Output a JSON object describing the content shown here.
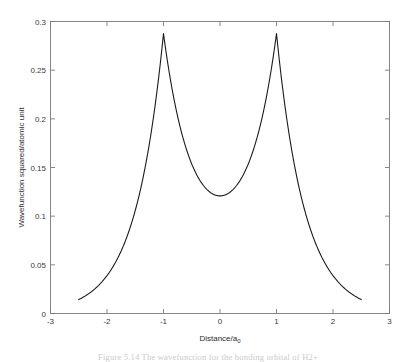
{
  "figure": {
    "background_color": "#ffffff",
    "axes_color": "#7a7a7a",
    "line_color": "#1a1a1a",
    "text_color": "#2b2b2b"
  },
  "caption": {
    "text": "Figure 5.14  The wavefunction for the bonding orbital of H2+"
  },
  "chart_data": {
    "type": "line",
    "title": "",
    "xlabel": "Distance/a",
    "xlabel_subscript": "0",
    "ylabel": "Wavefunction squared/atomic unit",
    "xlim": [
      -3,
      3
    ],
    "ylim": [
      0,
      0.3
    ],
    "xticks": [
      -3,
      -2,
      -1,
      0,
      1,
      2,
      3
    ],
    "xticklabels": [
      "-3",
      "-2",
      "-1",
      "0",
      "1",
      "2",
      "3"
    ],
    "yticks": [
      0,
      0.05,
      0.1,
      0.15,
      0.2,
      0.25,
      0.3
    ],
    "yticklabels": [
      "0",
      "0.05",
      "0.1",
      "0.15",
      "0.2",
      "0.25",
      "0.3"
    ],
    "grid": false,
    "legend": null,
    "series": [
      {
        "name": "Wavefunction squared",
        "description": "Symmetric double-cusp curve with sharp maxima at x = -1 and x = +1 and a shallow minimum near zero at x = 0; domain truncated to x in [-2.5, 2.5]",
        "x": [
          -2.5,
          -2.4,
          -2.3,
          -2.2,
          -2.1,
          -2.0,
          -1.9,
          -1.8,
          -1.7,
          -1.6,
          -1.5,
          -1.4,
          -1.3,
          -1.2,
          -1.1,
          -1.05,
          -1.0,
          -0.95,
          -0.9,
          -0.8,
          -0.7,
          -0.6,
          -0.5,
          -0.4,
          -0.3,
          -0.2,
          -0.1,
          0.0,
          0.1,
          0.2,
          0.3,
          0.4,
          0.5,
          0.6,
          0.7,
          0.8,
          0.9,
          0.95,
          1.0,
          1.05,
          1.1,
          1.2,
          1.3,
          1.4,
          1.5,
          1.6,
          1.7,
          1.8,
          1.9,
          2.0,
          2.1,
          2.2,
          2.3,
          2.4,
          2.5
        ],
        "y": [
          0.0151,
          0.017,
          0.0192,
          0.0217,
          0.0246,
          0.028,
          0.0319,
          0.0366,
          0.0421,
          0.0487,
          0.0568,
          0.0667,
          0.0791,
          0.095,
          0.12,
          0.18,
          0.2877,
          0.18,
          0.12,
          0.095,
          0.0791,
          0.0667,
          0.0568,
          0.0487,
          0.0421,
          0.0366,
          0.018,
          0.002,
          0.018,
          0.0366,
          0.0421,
          0.0487,
          0.0568,
          0.0667,
          0.0791,
          0.095,
          0.12,
          0.18,
          0.2877,
          0.18,
          0.12,
          0.095,
          0.0791,
          0.0667,
          0.0568,
          0.0487,
          0.0421,
          0.0366,
          0.0319,
          0.028,
          0.0246,
          0.0217,
          0.0192,
          0.017,
          0.0151
        ],
        "peaks": [
          {
            "x": -1,
            "y": 0.2877
          },
          {
            "x": 1,
            "y": 0.2877
          }
        ],
        "minimum": {
          "x": 0,
          "y": 0.002
        },
        "color": "#1a1a1a",
        "linewidth": 1.1
      }
    ]
  }
}
